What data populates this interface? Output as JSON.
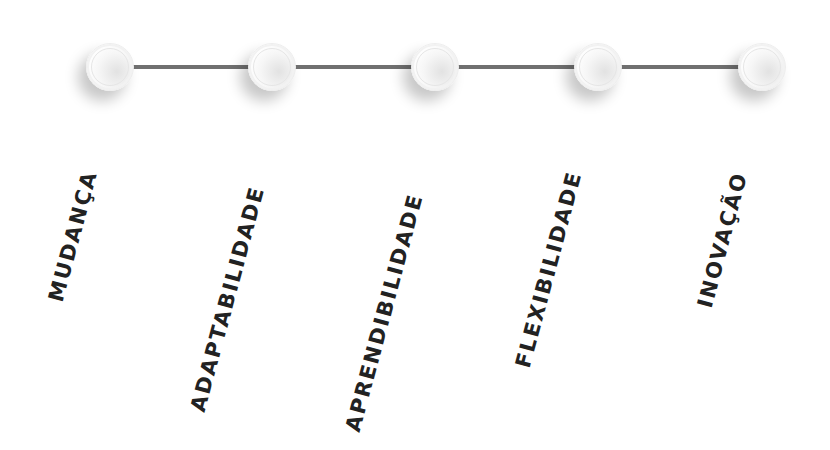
{
  "diagram": {
    "type": "timeline",
    "line_color": "#707070",
    "text_color": "#222222",
    "nodes": [
      {
        "label": "MUDANÇA",
        "x": 110
      },
      {
        "label": "ADAPTABILIDADE",
        "x": 272
      },
      {
        "label": "APRENDIBILIDADE",
        "x": 435
      },
      {
        "label": "FLEXIBILIDADE",
        "x": 598
      },
      {
        "label": "INOVAÇÃO",
        "x": 762
      }
    ]
  }
}
